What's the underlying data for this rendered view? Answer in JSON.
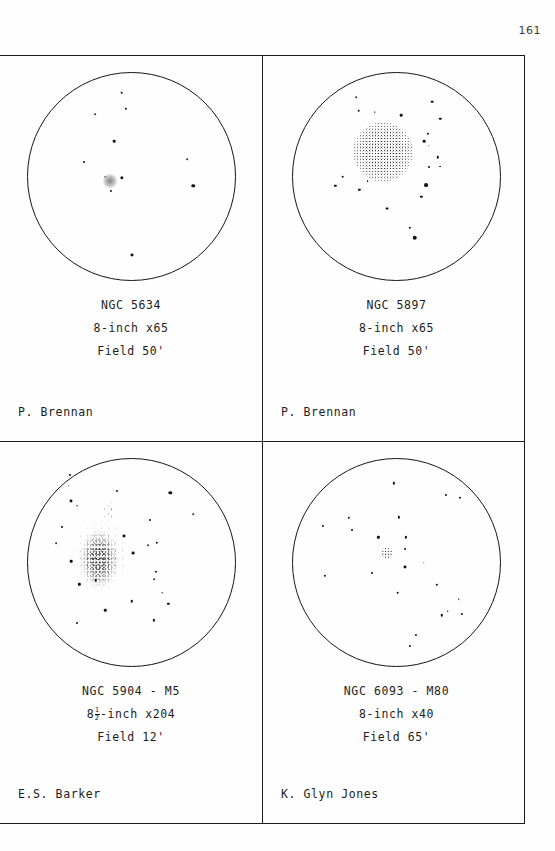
{
  "page": {
    "number": "161"
  },
  "panels": [
    {
      "object": "NGC 5634",
      "instrument": "8-inch x65",
      "field": "Field 50'",
      "observer": "P. Brennan",
      "sketch_kind": "small-faint-globular"
    },
    {
      "object": "NGC 5897",
      "instrument": "8-inch x65",
      "field": "Field 50'",
      "observer": "P. Brennan",
      "sketch_kind": "large-diffuse-globular"
    },
    {
      "object": "NGC 5904 - M5",
      "instrument_prefix": "8",
      "instrument_frac_num": "1",
      "instrument_frac_den": "2",
      "instrument_suffix": "-inch x204",
      "instrument": "8½-inch x204",
      "field": "Field 12'",
      "observer": "E.S. Barker",
      "sketch_kind": "resolved-rich-globular"
    },
    {
      "object": "NGC 6093 - M80",
      "instrument": "8-inch x40",
      "field": "Field 65'",
      "observer": "K. Glyn Jones",
      "sketch_kind": "compact-globular"
    }
  ],
  "chart_data": {
    "type": "scatter",
    "xlabel": "",
    "ylabel": "",
    "note": "Four eyepiece-field sketches; positions are fractions of circle diameter (0-1), size in px, darkness 0-1.",
    "fields": [
      {
        "name": "NGC 5634",
        "nebula": [
          {
            "x": 0.4,
            "y": 0.52,
            "r": 7.0,
            "kind": "soft"
          }
        ],
        "stars": [
          {
            "x": 0.455,
            "y": 0.095,
            "r": 1.5
          },
          {
            "x": 0.475,
            "y": 0.175,
            "r": 1.3
          },
          {
            "x": 0.325,
            "y": 0.2,
            "r": 1.0
          },
          {
            "x": 0.42,
            "y": 0.33,
            "r": 1.5
          },
          {
            "x": 0.272,
            "y": 0.43,
            "r": 1.2
          },
          {
            "x": 0.77,
            "y": 0.415,
            "r": 1.0
          },
          {
            "x": 0.375,
            "y": 0.5,
            "r": 0.9
          },
          {
            "x": 0.455,
            "y": 0.508,
            "r": 1.9
          },
          {
            "x": 0.405,
            "y": 0.57,
            "r": 1.2
          },
          {
            "x": 0.8,
            "y": 0.545,
            "r": 2.0
          },
          {
            "x": 0.505,
            "y": 0.88,
            "r": 1.7
          }
        ]
      },
      {
        "name": "NGC 5897",
        "nebula": [
          {
            "x": 0.435,
            "y": 0.38,
            "r": 30.0,
            "kind": "stipple"
          }
        ],
        "stars": [
          {
            "x": 0.305,
            "y": 0.118,
            "r": 0.9
          },
          {
            "x": 0.672,
            "y": 0.138,
            "r": 1.5
          },
          {
            "x": 0.318,
            "y": 0.182,
            "r": 1.5
          },
          {
            "x": 0.395,
            "y": 0.19,
            "r": 0.8
          },
          {
            "x": 0.523,
            "y": 0.205,
            "r": 1.5
          },
          {
            "x": 0.712,
            "y": 0.222,
            "r": 1.4
          },
          {
            "x": 0.65,
            "y": 0.295,
            "r": 1.3
          },
          {
            "x": 0.633,
            "y": 0.33,
            "r": 1.5
          },
          {
            "x": 0.655,
            "y": 0.352,
            "r": 0.9
          },
          {
            "x": 0.7,
            "y": 0.408,
            "r": 1.4
          },
          {
            "x": 0.655,
            "y": 0.455,
            "r": 1.1
          },
          {
            "x": 0.712,
            "y": 0.452,
            "r": 1.1
          },
          {
            "x": 0.24,
            "y": 0.5,
            "r": 1.5
          },
          {
            "x": 0.36,
            "y": 0.52,
            "r": 1.1
          },
          {
            "x": 0.205,
            "y": 0.545,
            "r": 1.3
          },
          {
            "x": 0.32,
            "y": 0.565,
            "r": 1.3
          },
          {
            "x": 0.642,
            "y": 0.543,
            "r": 2.2
          },
          {
            "x": 0.62,
            "y": 0.598,
            "r": 1.3
          },
          {
            "x": 0.453,
            "y": 0.655,
            "r": 1.6
          },
          {
            "x": 0.565,
            "y": 0.748,
            "r": 1.3
          },
          {
            "x": 0.588,
            "y": 0.795,
            "r": 2.6
          }
        ]
      },
      {
        "name": "NGC 5904 - M5",
        "nebula": [
          {
            "x": 0.355,
            "y": 0.47,
            "w": 62,
            "h": 78,
            "kind": "halo"
          },
          {
            "x": 0.35,
            "y": 0.48,
            "w": 44,
            "h": 58,
            "kind": "dense"
          },
          {
            "x": 0.395,
            "y": 0.25,
            "w": 16,
            "h": 26,
            "kind": "halo"
          }
        ],
        "stars": [
          {
            "x": 0.205,
            "y": 0.075,
            "r": 1.2
          },
          {
            "x": 0.2,
            "y": 0.13,
            "r": 0.9
          },
          {
            "x": 0.21,
            "y": 0.205,
            "r": 1.7
          },
          {
            "x": 0.24,
            "y": 0.225,
            "r": 1.0
          },
          {
            "x": 0.43,
            "y": 0.155,
            "r": 1.2
          },
          {
            "x": 0.69,
            "y": 0.165,
            "r": 1.9
          },
          {
            "x": 0.8,
            "y": 0.268,
            "r": 0.9
          },
          {
            "x": 0.592,
            "y": 0.293,
            "r": 1.2
          },
          {
            "x": 0.168,
            "y": 0.33,
            "r": 1.1
          },
          {
            "x": 0.14,
            "y": 0.405,
            "r": 1.0
          },
          {
            "x": 0.465,
            "y": 0.37,
            "r": 1.7
          },
          {
            "x": 0.625,
            "y": 0.405,
            "r": 1.4
          },
          {
            "x": 0.583,
            "y": 0.415,
            "r": 1.0
          },
          {
            "x": 0.21,
            "y": 0.495,
            "r": 1.5
          },
          {
            "x": 0.51,
            "y": 0.455,
            "r": 1.6
          },
          {
            "x": 0.62,
            "y": 0.545,
            "r": 1.3
          },
          {
            "x": 0.33,
            "y": 0.585,
            "r": 1.5
          },
          {
            "x": 0.25,
            "y": 0.605,
            "r": 1.3
          },
          {
            "x": 0.61,
            "y": 0.58,
            "r": 1.0
          },
          {
            "x": 0.65,
            "y": 0.645,
            "r": 0.9
          },
          {
            "x": 0.505,
            "y": 0.688,
            "r": 1.4
          },
          {
            "x": 0.68,
            "y": 0.7,
            "r": 1.3
          },
          {
            "x": 0.375,
            "y": 0.73,
            "r": 1.4
          },
          {
            "x": 0.238,
            "y": 0.79,
            "r": 1.2
          },
          {
            "x": 0.61,
            "y": 0.78,
            "r": 1.3
          }
        ]
      },
      {
        "name": "NGC 6093 - M80",
        "nebula": [
          {
            "x": 0.452,
            "y": 0.455,
            "r": 6.0,
            "kind": "stipple"
          }
        ],
        "stars": [
          {
            "x": 0.487,
            "y": 0.118,
            "r": 1.3
          },
          {
            "x": 0.74,
            "y": 0.172,
            "r": 1.2
          },
          {
            "x": 0.805,
            "y": 0.188,
            "r": 1.3
          },
          {
            "x": 0.27,
            "y": 0.285,
            "r": 1.4
          },
          {
            "x": 0.51,
            "y": 0.282,
            "r": 1.3
          },
          {
            "x": 0.143,
            "y": 0.325,
            "r": 1.2
          },
          {
            "x": 0.283,
            "y": 0.345,
            "r": 1.1
          },
          {
            "x": 0.412,
            "y": 0.378,
            "r": 1.3
          },
          {
            "x": 0.545,
            "y": 0.378,
            "r": 1.3
          },
          {
            "x": 0.54,
            "y": 0.435,
            "r": 1.1
          },
          {
            "x": 0.632,
            "y": 0.5,
            "r": 0.9
          },
          {
            "x": 0.54,
            "y": 0.52,
            "r": 1.7
          },
          {
            "x": 0.383,
            "y": 0.552,
            "r": 1.1
          },
          {
            "x": 0.155,
            "y": 0.565,
            "r": 1.3
          },
          {
            "x": 0.695,
            "y": 0.608,
            "r": 1.3
          },
          {
            "x": 0.505,
            "y": 0.645,
            "r": 1.5
          },
          {
            "x": 0.8,
            "y": 0.678,
            "r": 0.9
          },
          {
            "x": 0.748,
            "y": 0.735,
            "r": 0.9
          },
          {
            "x": 0.718,
            "y": 0.755,
            "r": 1.4
          },
          {
            "x": 0.815,
            "y": 0.748,
            "r": 1.2
          },
          {
            "x": 0.595,
            "y": 0.85,
            "r": 1.2
          },
          {
            "x": 0.565,
            "y": 0.905,
            "r": 1.2
          }
        ]
      }
    ]
  }
}
